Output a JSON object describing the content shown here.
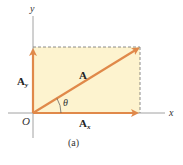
{
  "diagram": {
    "caption": "(a)",
    "axes": {
      "x_label": "x",
      "y_label": "y",
      "origin_label": "O"
    },
    "vectors": [
      {
        "name": "A",
        "label": "A",
        "subscript": "",
        "description": "resultant vector from origin to top-right corner"
      },
      {
        "name": "Ax",
        "label": "A",
        "subscript": "x",
        "description": "x-component along x-axis"
      },
      {
        "name": "Ay",
        "label": "A",
        "subscript": "y",
        "description": "y-component along y-axis"
      }
    ],
    "angle_label": "θ",
    "colors": {
      "vector": "#e0894a",
      "rectangle_fill": "#fdf3cf",
      "axis": "#8a8a8a",
      "dashed": "#6e6e6e"
    }
  }
}
